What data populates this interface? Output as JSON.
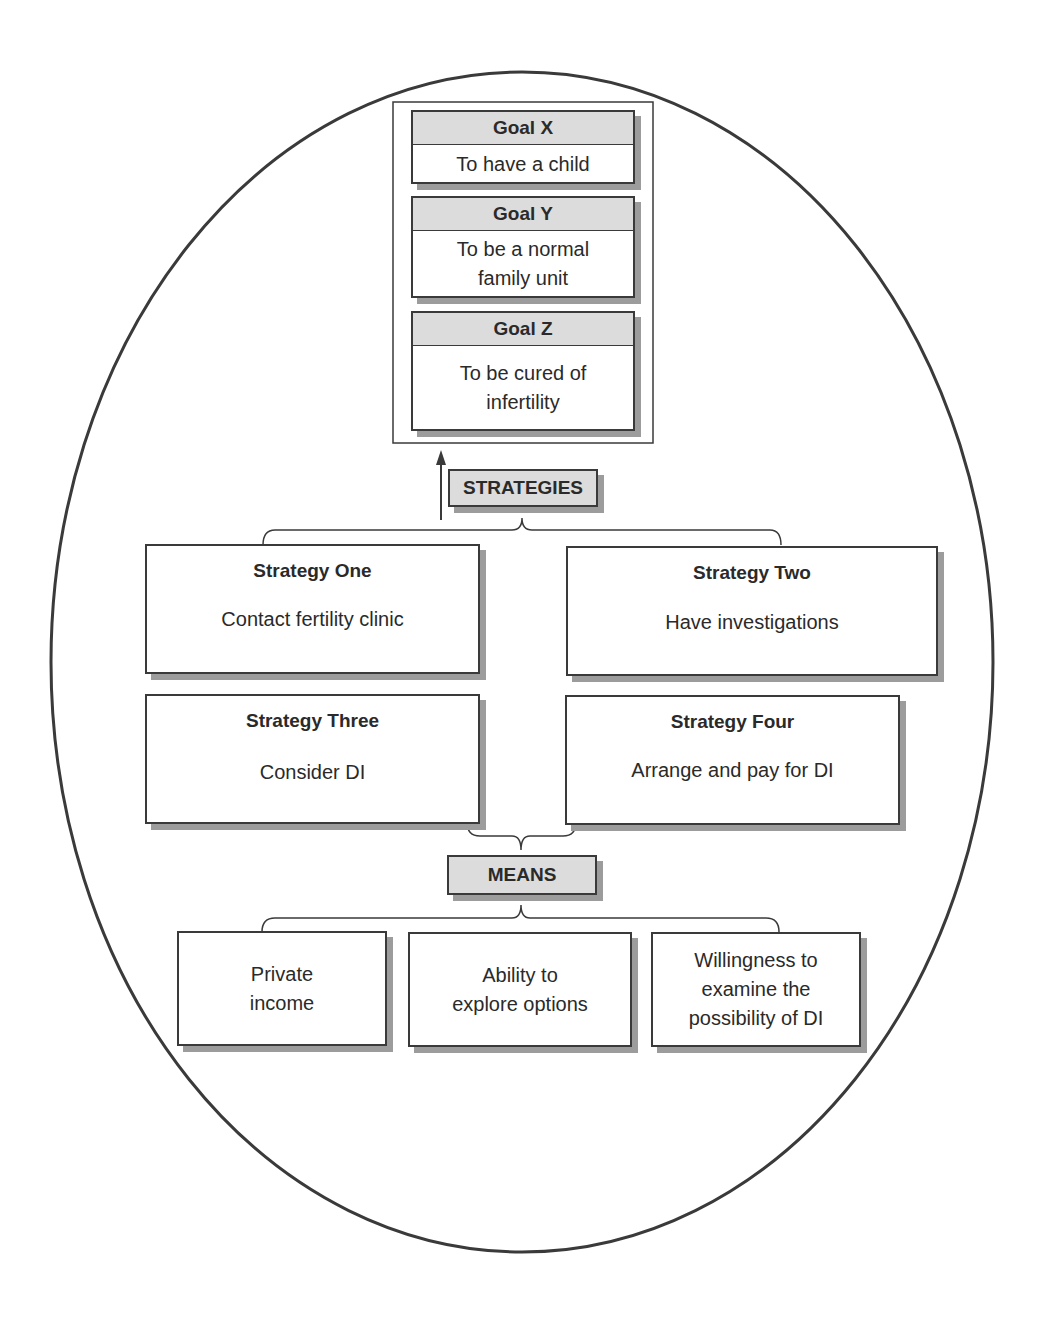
{
  "goals": [
    {
      "title": "Goal X",
      "text": "To have a child"
    },
    {
      "title": "Goal Y",
      "text_line1": "To be a normal",
      "text_line2": "family unit"
    },
    {
      "title": "Goal Z",
      "text_line1": "To be cured of",
      "text_line2": "infertility"
    }
  ],
  "strategies_label": "STRATEGIES",
  "strategies": [
    {
      "title": "Strategy One",
      "text": "Contact fertility clinic"
    },
    {
      "title": "Strategy Two",
      "text": "Have investigations"
    },
    {
      "title": "Strategy Three",
      "text": "Consider DI"
    },
    {
      "title": "Strategy Four",
      "text": "Arrange and pay for DI"
    }
  ],
  "means_label": "MEANS",
  "means": [
    {
      "text": "Private\nincome"
    },
    {
      "text": "Ability to\nexplore options"
    },
    {
      "text": "Willingness to\nexamine the\npossibility of DI"
    }
  ],
  "colors": {
    "stroke": "#3a3a3a",
    "header_fill": "#dcdcdc",
    "shadow": "#9c9c9c"
  }
}
